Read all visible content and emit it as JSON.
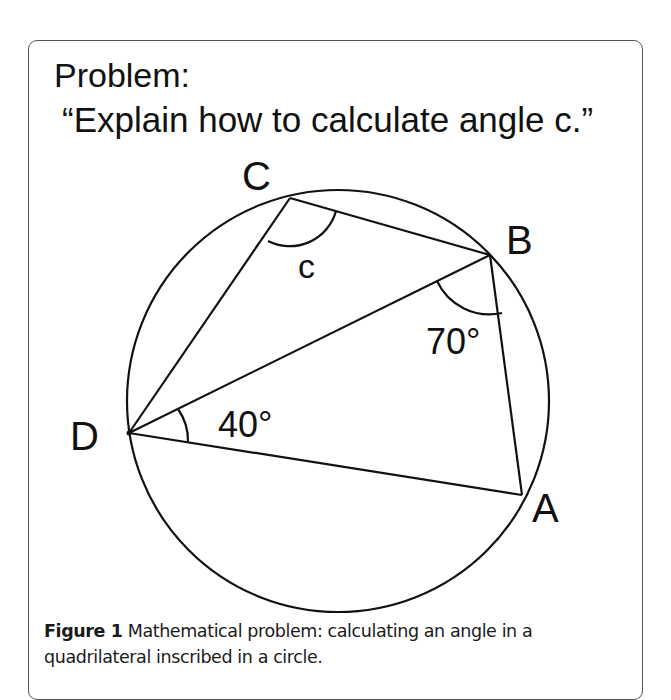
{
  "problem": {
    "title": "Problem:",
    "question": "“Explain how to calculate angle c.”"
  },
  "diagram": {
    "circle": {
      "cx": 338,
      "cy": 401,
      "r": 211
    },
    "points": {
      "A": {
        "x": 522,
        "y": 495
      },
      "B": {
        "x": 490,
        "y": 255
      },
      "C": {
        "x": 290,
        "y": 198
      },
      "D": {
        "x": 129,
        "y": 433
      }
    },
    "labels": {
      "A": "A",
      "B": "B",
      "C": "C",
      "D": "D",
      "angle_c": "c",
      "angle_B": "70°",
      "angle_D": "40°"
    },
    "stroke_color": "#111111"
  },
  "caption": {
    "label": "Figure 1",
    "text": " Mathematical problem: calculating an angle in a quadrilateral inscribed in a circle."
  }
}
